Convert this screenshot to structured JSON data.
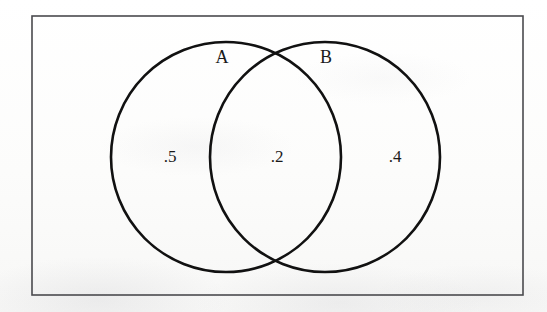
{
  "figure": {
    "type": "venn-diagram",
    "title": "",
    "background_color": "#fdfdfc",
    "frame": {
      "name": "universal-set-rectangle",
      "stroke_color": "#4a4a4e",
      "x": 32,
      "y": 16,
      "width": 491,
      "height": 279
    },
    "stroke_color": "#111111",
    "sets": [
      {
        "id": "A",
        "label": "A",
        "label_x": 222,
        "label_y": 59,
        "cx": 226,
        "cy": 157,
        "r": 115
      },
      {
        "id": "B",
        "label": "B",
        "label_x": 326,
        "label_y": 59,
        "cx": 325,
        "cy": 157,
        "r": 115
      }
    ],
    "regions": [
      {
        "id": "A-only",
        "label": ".5",
        "value": 0.5,
        "description": "A only",
        "x": 170,
        "y": 158
      },
      {
        "id": "A-and-B",
        "label": ".2",
        "value": 0.2,
        "description": "A intersect B",
        "x": 277,
        "y": 158
      },
      {
        "id": "B-only",
        "label": ".4",
        "value": 0.4,
        "description": "B only",
        "x": 395,
        "y": 158
      }
    ]
  }
}
